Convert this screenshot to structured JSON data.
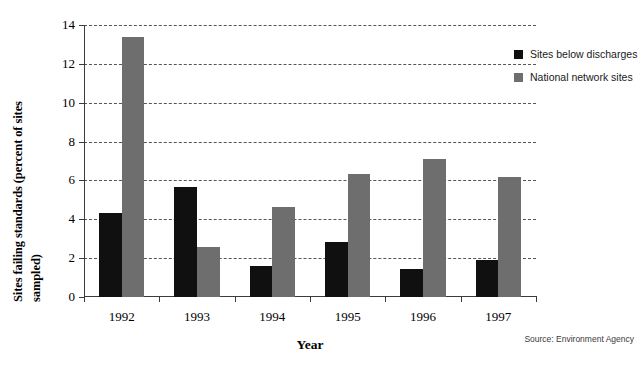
{
  "chart_data": {
    "type": "bar",
    "title": "",
    "xlabel": "Year",
    "ylabel_line1": "Sites failing standards (percent of sites",
    "ylabel_line2": "sampled)",
    "categories": [
      "1992",
      "1993",
      "1994",
      "1995",
      "1996",
      "1997"
    ],
    "series": [
      {
        "name": "Sites below discharges",
        "color": "#101010",
        "values": [
          4.3,
          5.65,
          1.6,
          2.85,
          1.45,
          1.9
        ]
      },
      {
        "name": "National network sites",
        "color": "#6e6e6e",
        "values": [
          13.4,
          2.55,
          4.65,
          6.35,
          7.1,
          6.2
        ]
      }
    ],
    "ylim": [
      0,
      14
    ],
    "yticks": [
      0,
      2,
      4,
      6,
      8,
      10,
      12,
      14
    ],
    "ytick_labels": [
      "0",
      "2",
      "4",
      "6",
      "8",
      "10",
      "12",
      "14"
    ],
    "grid": true,
    "grid_style": "dashed-horizontal",
    "legend_position": "right"
  },
  "legend": {
    "items": [
      {
        "label": "Sites below discharges",
        "swatch": "#101010"
      },
      {
        "label": "National network sites",
        "swatch": "#6e6e6e"
      }
    ]
  },
  "footer": {
    "source": "Source: Environment Agency"
  }
}
